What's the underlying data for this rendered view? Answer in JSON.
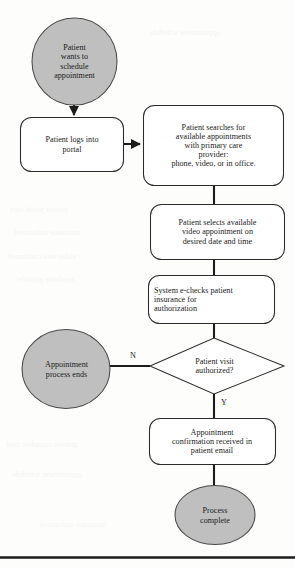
{
  "figure": {
    "type": "flowchart",
    "orientation": "top-to-bottom",
    "colors": {
      "terminator_fill": "#bfbfbf",
      "terminator_stroke": "#4a4a4a",
      "process_fill": "#ffffff",
      "process_stroke": "#2b2b2b",
      "decision_fill": "#ffffff",
      "decision_stroke": "#2b2b2b",
      "connector": "#1c1c1c",
      "text": "#1a1a1a",
      "page_background": "#fdfdfc",
      "footer_rule": "#1c1c1c"
    }
  },
  "nodes": {
    "start": {
      "shape": "ellipse",
      "lines": [
        "Patient",
        "wants to",
        "schedule",
        "appointment"
      ],
      "text_align": "center"
    },
    "login": {
      "shape": "rounded-rect",
      "lines": [
        "Patient logs into",
        "portal"
      ],
      "text_align": "center"
    },
    "search": {
      "shape": "rounded-rect",
      "lines": [
        "Patient searches for",
        "available appointments",
        "with primary care",
        "provider:",
        "phone, video, or in office."
      ],
      "text_align": "center"
    },
    "select": {
      "shape": "rounded-rect",
      "lines": [
        "Patient selects available",
        "video appointment on",
        "desired date and time"
      ],
      "text_align": "center"
    },
    "echeck": {
      "shape": "rounded-rect",
      "lines": [
        "System e-checks patient",
        "insurance for",
        "authorization"
      ],
      "text_align": "left"
    },
    "decision": {
      "shape": "diamond",
      "lines": [
        "Patient visit",
        "authorized?"
      ],
      "text_align": "center"
    },
    "ends": {
      "shape": "ellipse",
      "lines": [
        "Appointment",
        "process ends"
      ],
      "text_align": "center"
    },
    "confirm": {
      "shape": "rounded-rect",
      "lines": [
        "Appointment",
        "confirmation received in",
        "patient email"
      ],
      "text_align": "center"
    },
    "complete": {
      "shape": "ellipse",
      "lines": [
        "Process",
        "complete"
      ],
      "text_align": "center"
    }
  },
  "edges": [
    {
      "from": "start",
      "to": "login",
      "label": ""
    },
    {
      "from": "login",
      "to": "search",
      "label": ""
    },
    {
      "from": "search",
      "to": "select",
      "label": ""
    },
    {
      "from": "select",
      "to": "echeck",
      "label": ""
    },
    {
      "from": "echeck",
      "to": "decision",
      "label": ""
    },
    {
      "from": "decision",
      "to": "ends",
      "label": "N"
    },
    {
      "from": "decision",
      "to": "confirm",
      "label": "Y"
    },
    {
      "from": "confirm",
      "to": "complete",
      "label": ""
    }
  ],
  "edge_labels": {
    "no": "N",
    "yes": "Y"
  },
  "bleed_text": {
    "l1": "appointment schedule",
    "l2": "patient portal care",
    "l3": "insurance authorized",
    "l4": "video visit confirmed",
    "l5": "available provider",
    "l6": "process complete mail"
  }
}
